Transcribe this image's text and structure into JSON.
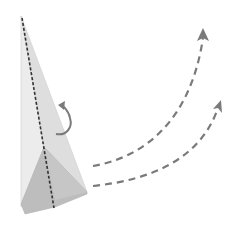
{
  "diagram": {
    "description": "Paper airplane folding step: rotate the plane and throw it forward",
    "elements": {
      "plane": {
        "label": "paper airplane",
        "body_color": "#e6e6e6",
        "wing_color": "#bdbdbd",
        "center_fold": "dashed center crease"
      },
      "rotate_arrow": {
        "label": "rotate"
      },
      "flight_paths": [
        {
          "label": "flight path 1",
          "style": "dashed",
          "color": "#777777"
        },
        {
          "label": "flight path 2",
          "style": "dashed",
          "color": "#777777"
        }
      ]
    },
    "colors": {
      "background": "#ffffff",
      "plane_light": "#e8e8e8",
      "plane_mid": "#d9d9d9",
      "plane_dark": "#bcbcbc",
      "fold_line": "#333333",
      "arrow": "#777777"
    }
  }
}
